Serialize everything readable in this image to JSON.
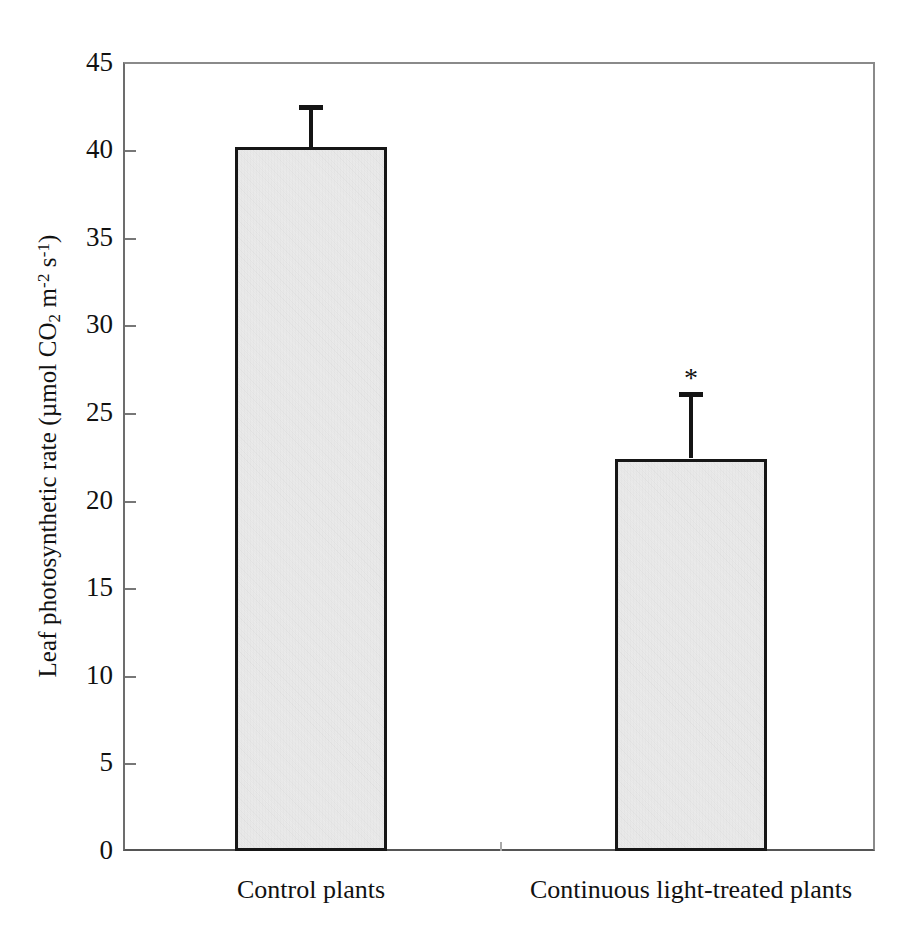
{
  "chart_data": {
    "type": "bar",
    "title": "",
    "xlabel": "",
    "ylabel": "Leaf photosynthetic rate (µmol CO2 m-2 s-1)",
    "ylabel_parts": {
      "prefix": "Leaf photosynthetic rate (µmol CO",
      "sub_2": "2",
      "mid": " m",
      "sup_minus2": "-2",
      "space": " s",
      "sup_minus1": "-1",
      "suffix": ")"
    },
    "categories": [
      "Control plants",
      "Continuous light-treated plants"
    ],
    "values": [
      40.2,
      22.4
    ],
    "errors": [
      2.4,
      3.8
    ],
    "error_type": "upper-only",
    "annotations": [
      "",
      "*"
    ],
    "ylim": [
      0,
      45
    ],
    "yticks": [
      0,
      5,
      10,
      15,
      20,
      25,
      30,
      35,
      40,
      45
    ],
    "ytick_labels": [
      "0",
      "5",
      "10",
      "15",
      "20",
      "25",
      "30",
      "35",
      "40",
      "45"
    ],
    "grid": false,
    "legend": null,
    "bar_fill_color": "#e4e4e4",
    "bar_edge_color": "#161616",
    "axis_color": "#6d6d6d",
    "text_color": "#111111"
  },
  "figure": {
    "background_color": "#ffffff",
    "significance_note": "*"
  }
}
